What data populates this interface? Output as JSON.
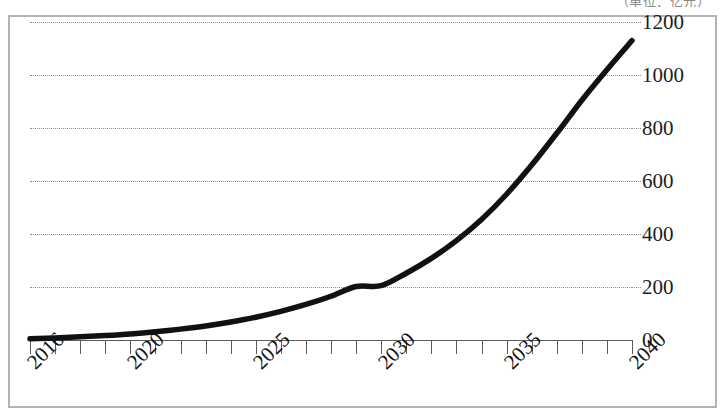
{
  "caption": {
    "text": "（单位：亿元）"
  },
  "chart_data": {
    "type": "line",
    "title": "",
    "subtitle": "",
    "xlabel": "",
    "ylabel": "",
    "grid": true,
    "legend": false,
    "legend_position": "none",
    "line_color": "#111111",
    "grid_color": "#8f8f8f",
    "frame_color": "#b3b3b3",
    "axis_color": "#5a5a5a",
    "xlim": [
      2016,
      2040
    ],
    "ylim": [
      0,
      1200
    ],
    "yticks": [
      0,
      200,
      400,
      600,
      800,
      1000,
      1200
    ],
    "ytick_labels": [
      "0",
      "200",
      "400",
      "600",
      "800",
      "1000",
      "1200"
    ],
    "xticks": [
      2016,
      2017,
      2018,
      2019,
      2020,
      2021,
      2022,
      2023,
      2024,
      2025,
      2026,
      2027,
      2028,
      2029,
      2030,
      2031,
      2032,
      2033,
      2034,
      2035,
      2036,
      2037,
      2038,
      2039,
      2040
    ],
    "xtick_labels_shown": [
      "2016",
      "2020",
      "2025",
      "2030",
      "2035",
      "2040"
    ],
    "xtick_label_rotation": -45,
    "series": [
      {
        "name": "",
        "x": [
          2016,
          2017,
          2018,
          2019,
          2020,
          2021,
          2022,
          2023,
          2024,
          2025,
          2026,
          2027,
          2028,
          2029,
          2030,
          2031,
          2032,
          2033,
          2034,
          2035,
          2036,
          2037,
          2038,
          2039,
          2040
        ],
        "values": [
          5,
          8,
          12,
          17,
          23,
          31,
          41,
          53,
          68,
          86,
          108,
          134,
          165,
          202,
          205,
          252,
          308,
          375,
          455,
          550,
          660,
          780,
          905,
          1020,
          1130
        ]
      }
    ]
  },
  "yaxis_labels": [
    {
      "value": 1200,
      "label": "1200"
    },
    {
      "value": 1000,
      "label": "1000"
    },
    {
      "value": 800,
      "label": "800"
    },
    {
      "value": 600,
      "label": "600"
    },
    {
      "value": 400,
      "label": "400"
    },
    {
      "value": 200,
      "label": "200"
    },
    {
      "value": 0,
      "label": "0"
    }
  ],
  "xaxis_labels": [
    {
      "year": 2016,
      "label": "2016"
    },
    {
      "year": 2020,
      "label": "2020"
    },
    {
      "year": 2025,
      "label": "2025"
    },
    {
      "year": 2030,
      "label": "2030"
    },
    {
      "year": 2035,
      "label": "2035"
    },
    {
      "year": 2040,
      "label": "2040"
    }
  ]
}
